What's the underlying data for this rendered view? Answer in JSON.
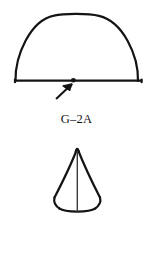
{
  "page": {
    "background_color": "#ffffff",
    "ink_color": "#141414",
    "width": 153,
    "height": 261
  },
  "figures": [
    {
      "id": "g-2a",
      "caption": "G–2A",
      "shape": "hemisphere-dome",
      "description": "Dome / half-round outline resting on a horizontal base line",
      "annotation": {
        "marker": "dot",
        "pointer": "arrow",
        "direction": "up-right"
      }
    },
    {
      "id": "g-2b",
      "caption": "G–2B",
      "shape": "cone",
      "description": "Cone outline with apex at top, curved base and vertical center line",
      "annotation": {
        "marker": "none",
        "pointer": "none",
        "direction": ""
      }
    }
  ]
}
